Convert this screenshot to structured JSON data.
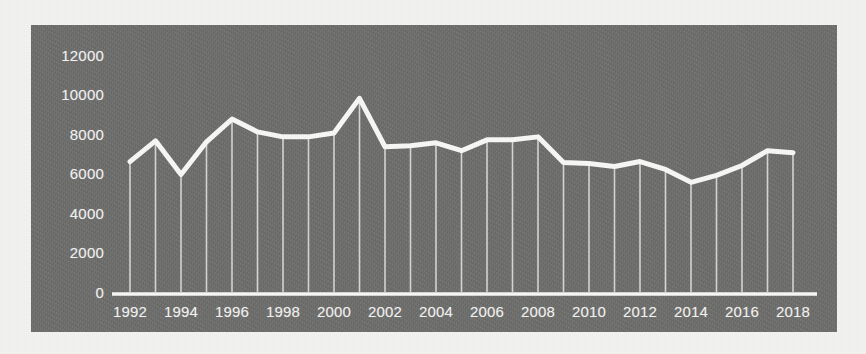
{
  "figure": {
    "panel_background_color": "#6f706e",
    "line_color": "#f5f5f3",
    "drop_line_color": "#d9d9d6",
    "axis_color": "#f5f5f3",
    "page_background_color": "#f3f3f1"
  },
  "chart_data": {
    "type": "line",
    "title": "",
    "subtitle": "",
    "xlabel": "",
    "ylabel": "",
    "xlim": [
      1991.4,
      2018.6
    ],
    "ylim": [
      0,
      12800
    ],
    "grid": false,
    "legend_position": "none",
    "drop_lines": true,
    "y_ticks": [
      0,
      2000,
      4000,
      6000,
      8000,
      10000,
      12000
    ],
    "y_tick_labels": [
      "0",
      "2000",
      "4000",
      "6000",
      "8000",
      "10000",
      "12000"
    ],
    "x_ticks": [
      1992,
      1994,
      1996,
      1998,
      2000,
      2002,
      2004,
      2006,
      2008,
      2010,
      2012,
      2014,
      2016,
      2018
    ],
    "x_tick_labels": [
      "1992",
      "1994",
      "1996",
      "1998",
      "2000",
      "2002",
      "2004",
      "2006",
      "2008",
      "2010",
      "2012",
      "2014",
      "2016",
      "2018"
    ],
    "x": [
      1992,
      1993,
      1994,
      1995,
      1996,
      1997,
      1998,
      1999,
      2000,
      2001,
      2002,
      2003,
      2004,
      2005,
      2006,
      2007,
      2008,
      2009,
      2010,
      2011,
      2012,
      2013,
      2014,
      2015,
      2016,
      2017,
      2018
    ],
    "series": [
      {
        "name": "",
        "values": [
          6700,
          7750,
          6050,
          7700,
          8850,
          8200,
          7950,
          7950,
          8150,
          9900,
          7450,
          7500,
          7650,
          7250,
          7800,
          7800,
          7950,
          6650,
          6600,
          6450,
          6700,
          6300,
          5650,
          6000,
          6500,
          7250,
          7150
        ]
      }
    ]
  }
}
